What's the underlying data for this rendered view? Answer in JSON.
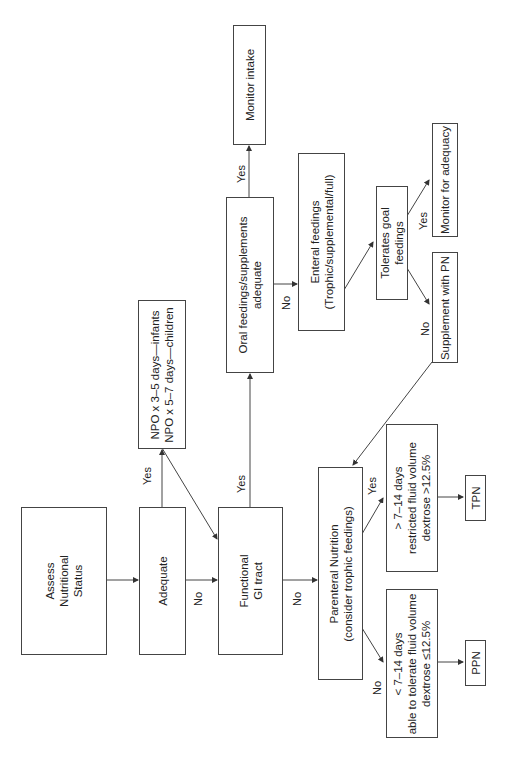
{
  "diagram": {
    "orientation": "rotated 90deg counter-clockwise",
    "nodes": {
      "assess": {
        "lines": [
          "Assess",
          "Nutritional",
          "Status"
        ]
      },
      "adequate": {
        "lines": [
          "Adequate"
        ]
      },
      "npo": {
        "lines": [
          "NPO x 3–5 days—infants",
          "NPO x 5–7 days—children"
        ]
      },
      "functional_gi": {
        "lines": [
          "Functional",
          "GI tract"
        ]
      },
      "oral": {
        "lines": [
          "Oral feedings/supplements",
          "adequate"
        ]
      },
      "monitor_intake": {
        "lines": [
          "Monitor intake"
        ]
      },
      "enteral": {
        "lines": [
          "Enteral feedings",
          "(Trophic/supplemental/full)"
        ]
      },
      "tolerates": {
        "lines": [
          "Tolerates goal",
          "feedings"
        ]
      },
      "monitor_adequacy": {
        "lines": [
          "Monitor for adequacy"
        ]
      },
      "supplement_pn": {
        "lines": [
          "Supplement with PN"
        ]
      },
      "parenteral": {
        "lines": [
          "Parenteral Nutrition",
          "(consider trophic feedings)"
        ]
      },
      "gt_7_14": {
        "lines": [
          "> 7–14 days",
          "restricted fluid volume",
          "dextrose >12.5%"
        ]
      },
      "lt_7_14": {
        "lines": [
          "< 7–14 days",
          "able to tolerate fluid volume",
          "dextrose ≤12.5%"
        ]
      },
      "tpn": {
        "lines": [
          "TPN"
        ]
      },
      "ppn": {
        "lines": [
          "PPN"
        ]
      }
    },
    "edge_labels": {
      "adequate_yes": "Yes",
      "adequate_no": "No",
      "gi_yes": "Yes",
      "gi_no": "No",
      "oral_yes": "Yes",
      "oral_no": "No",
      "tolerates_yes": "Yes",
      "tolerates_no": "No",
      "pn_yes": "Yes",
      "pn_no": "No"
    },
    "line_color": "#444444"
  }
}
